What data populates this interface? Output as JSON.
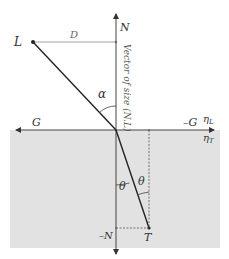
{
  "figure": {
    "labels": {
      "L": "L",
      "D": "D",
      "N": "N",
      "vector_size": "Vector of size (N.L)",
      "alpha": "α",
      "G": "G",
      "neg_G": "–G",
      "eta_L_base": "η",
      "eta_L_sub": "L",
      "eta_T_base": "η",
      "eta_T_sub": "T",
      "theta_left": "θ",
      "theta_right": "θ",
      "neg_N": "–N",
      "T": "T"
    },
    "colors": {
      "background": "#ffffff",
      "medium_fill": "#e2e2e2",
      "line": "#333333",
      "guide_line": "#888888"
    }
  }
}
